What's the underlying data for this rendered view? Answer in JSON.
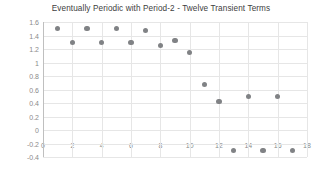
{
  "chart_data": {
    "type": "scatter",
    "title": "Eventually Periodic with Period-2 - Twelve Transient Terms",
    "xlabel": "",
    "ylabel": "",
    "xlim": [
      0,
      18
    ],
    "ylim": [
      -0.4,
      1.6
    ],
    "xticks": [
      0,
      2,
      4,
      6,
      8,
      10,
      12,
      14,
      16,
      18
    ],
    "yticks": [
      -0.4,
      -0.2,
      0,
      0.2,
      0.4,
      0.6,
      0.8,
      1,
      1.2,
      1.4,
      1.6
    ],
    "ytick_labels": [
      "-0.4",
      "-0.2",
      "0",
      "0.2",
      "0.4",
      "0.6",
      "0.8",
      "1",
      "1.2",
      "1.4",
      "1.6"
    ],
    "xtick_labels": [
      "0",
      "2",
      "4",
      "6",
      "8",
      "10",
      "12",
      "14",
      "16",
      "18"
    ],
    "grid": true,
    "legend": false,
    "marker_color": "#808285",
    "grid_color": "#e6e6e6",
    "background": "#ffffff",
    "x": [
      1,
      2,
      3,
      4,
      5,
      6,
      7,
      8,
      9,
      10,
      11,
      12,
      13,
      14,
      15,
      16,
      17
    ],
    "values": [
      1.5,
      1.3,
      1.5,
      1.3,
      1.5,
      1.3,
      1.48,
      1.25,
      1.32,
      1.15,
      0.68,
      0.42,
      -0.3,
      0.5,
      -0.3,
      0.5,
      -0.3
    ],
    "series": [
      {
        "name": "sequence",
        "points": [
          {
            "x": 1,
            "y": 1.5
          },
          {
            "x": 2,
            "y": 1.3
          },
          {
            "x": 3,
            "y": 1.5
          },
          {
            "x": 4,
            "y": 1.3
          },
          {
            "x": 5,
            "y": 1.5
          },
          {
            "x": 6,
            "y": 1.3
          },
          {
            "x": 7,
            "y": 1.48
          },
          {
            "x": 8,
            "y": 1.25
          },
          {
            "x": 9,
            "y": 1.32
          },
          {
            "x": 10,
            "y": 1.15
          },
          {
            "x": 11,
            "y": 0.68
          },
          {
            "x": 12,
            "y": 0.42
          },
          {
            "x": 13,
            "y": -0.3
          },
          {
            "x": 14,
            "y": 0.5
          },
          {
            "x": 15,
            "y": -0.3
          },
          {
            "x": 16,
            "y": 0.5
          },
          {
            "x": 17,
            "y": -0.3
          }
        ]
      }
    ]
  }
}
